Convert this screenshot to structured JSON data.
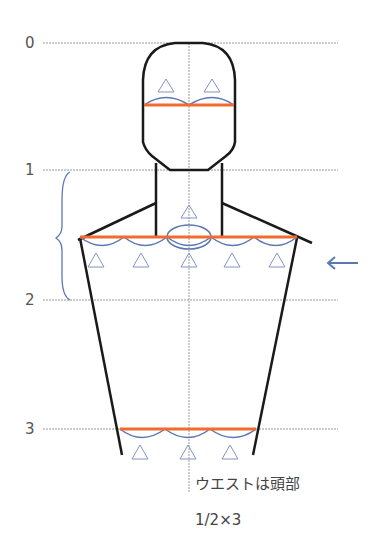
{
  "diagram": {
    "type": "body-proportion-diagram",
    "scale_labels": [
      "0",
      "1",
      "2",
      "3"
    ],
    "caption_line1": "ウエストは頭部",
    "caption_line2": "1/2×3",
    "annotations": {
      "head_width": "2 × △ (half-head units)",
      "shoulder_width": "5 × △",
      "neck_marker": "△",
      "waist_width": "3 × △"
    },
    "arrow_label": "←",
    "colors": {
      "outline": "#1a1a1a",
      "measure_line": "#f26a2e",
      "arc": "#5b78b5",
      "triangle": "#8294c4",
      "guide": "#9a9a9a",
      "arrow": "#5b78b5"
    }
  }
}
